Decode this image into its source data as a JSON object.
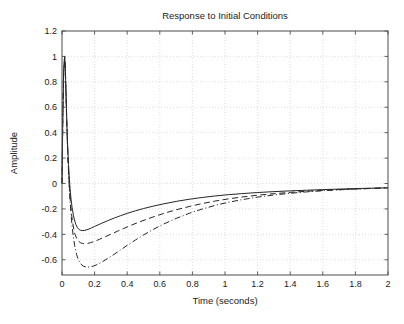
{
  "figure": {
    "background": "#ffffff",
    "axes_color": "#4d4d4d",
    "grid_color": "#c8c8c8",
    "text_color": "#1a1a1a"
  },
  "chart_data": {
    "type": "line",
    "title": "Response to Initial Conditions",
    "xlabel": "Time (seconds)",
    "ylabel": "Amplitude",
    "xlim": [
      0,
      2
    ],
    "ylim": [
      -0.72,
      1.2
    ],
    "xticks": [
      0,
      0.2,
      0.4,
      0.6,
      0.8,
      1,
      1.2,
      1.4,
      1.6,
      1.8,
      2
    ],
    "xticklabels": [
      "0",
      "0.2",
      "0.4",
      "0.6",
      "0.8",
      "1",
      "1.2",
      "1.4",
      "1.6",
      "1.8",
      "2"
    ],
    "yticks": [
      -0.6,
      -0.4,
      -0.2,
      0,
      0.2,
      0.4,
      0.6,
      0.8,
      1,
      1.2
    ],
    "yticklabels": [
      "-0.6",
      "-0.4",
      "-0.2",
      "0",
      "0.2",
      "0.4",
      "0.6",
      "0.8",
      "1",
      "1.2"
    ],
    "grid": true,
    "grid_style": "dotted",
    "legend": null,
    "series": [
      {
        "name": "series-solid",
        "style": "solid",
        "color": "#262626",
        "width": 1.0,
        "points": [
          [
            0.0,
            0.0
          ],
          [
            0.005,
            0.52
          ],
          [
            0.01,
            0.87
          ],
          [
            0.016,
            1.0
          ],
          [
            0.02,
            0.93
          ],
          [
            0.025,
            0.7
          ],
          [
            0.03,
            0.47
          ],
          [
            0.035,
            0.29
          ],
          [
            0.04,
            0.15
          ],
          [
            0.045,
            0.04
          ],
          [
            0.05,
            -0.05
          ],
          [
            0.056,
            -0.13
          ],
          [
            0.062,
            -0.19
          ],
          [
            0.07,
            -0.25
          ],
          [
            0.078,
            -0.295
          ],
          [
            0.086,
            -0.325
          ],
          [
            0.095,
            -0.348
          ],
          [
            0.105,
            -0.362
          ],
          [
            0.115,
            -0.369
          ],
          [
            0.125,
            -0.371
          ],
          [
            0.14,
            -0.369
          ],
          [
            0.16,
            -0.361
          ],
          [
            0.18,
            -0.35
          ],
          [
            0.2,
            -0.338
          ],
          [
            0.24,
            -0.315
          ],
          [
            0.28,
            -0.293
          ],
          [
            0.32,
            -0.272
          ],
          [
            0.36,
            -0.253
          ],
          [
            0.4,
            -0.235
          ],
          [
            0.45,
            -0.215
          ],
          [
            0.5,
            -0.197
          ],
          [
            0.56,
            -0.178
          ],
          [
            0.62,
            -0.161
          ],
          [
            0.7,
            -0.141
          ],
          [
            0.78,
            -0.124
          ],
          [
            0.86,
            -0.11
          ],
          [
            0.94,
            -0.098
          ],
          [
            1.02,
            -0.088
          ],
          [
            1.1,
            -0.08
          ],
          [
            1.2,
            -0.071
          ],
          [
            1.3,
            -0.064
          ],
          [
            1.4,
            -0.058
          ],
          [
            1.5,
            -0.053
          ],
          [
            1.6,
            -0.048
          ],
          [
            1.7,
            -0.044
          ],
          [
            1.8,
            -0.04
          ],
          [
            1.9,
            -0.037
          ],
          [
            2.0,
            -0.034
          ]
        ]
      },
      {
        "name": "series-dashed",
        "style": "dashed",
        "color": "#262626",
        "width": 1.0,
        "points": [
          [
            0.0,
            0.0
          ],
          [
            0.005,
            0.52
          ],
          [
            0.01,
            0.87
          ],
          [
            0.016,
            1.0
          ],
          [
            0.02,
            0.92
          ],
          [
            0.025,
            0.68
          ],
          [
            0.03,
            0.44
          ],
          [
            0.035,
            0.25
          ],
          [
            0.04,
            0.1
          ],
          [
            0.046,
            -0.04
          ],
          [
            0.052,
            -0.15
          ],
          [
            0.058,
            -0.235
          ],
          [
            0.065,
            -0.305
          ],
          [
            0.072,
            -0.358
          ],
          [
            0.08,
            -0.4
          ],
          [
            0.09,
            -0.433
          ],
          [
            0.1,
            -0.452
          ],
          [
            0.112,
            -0.465
          ],
          [
            0.125,
            -0.472
          ],
          [
            0.14,
            -0.474
          ],
          [
            0.155,
            -0.472
          ],
          [
            0.175,
            -0.466
          ],
          [
            0.2,
            -0.455
          ],
          [
            0.23,
            -0.439
          ],
          [
            0.26,
            -0.422
          ],
          [
            0.3,
            -0.399
          ],
          [
            0.34,
            -0.376
          ],
          [
            0.38,
            -0.353
          ],
          [
            0.42,
            -0.331
          ],
          [
            0.47,
            -0.305
          ],
          [
            0.52,
            -0.281
          ],
          [
            0.58,
            -0.254
          ],
          [
            0.64,
            -0.229
          ],
          [
            0.7,
            -0.207
          ],
          [
            0.78,
            -0.181
          ],
          [
            0.86,
            -0.158
          ],
          [
            0.94,
            -0.138
          ],
          [
            1.02,
            -0.121
          ],
          [
            1.1,
            -0.107
          ],
          [
            1.2,
            -0.092
          ],
          [
            1.3,
            -0.08
          ],
          [
            1.4,
            -0.07
          ],
          [
            1.5,
            -0.061
          ],
          [
            1.6,
            -0.054
          ],
          [
            1.7,
            -0.048
          ],
          [
            1.8,
            -0.043
          ],
          [
            1.9,
            -0.038
          ],
          [
            2.0,
            -0.034
          ]
        ]
      },
      {
        "name": "series-dashdot",
        "style": "dashdot",
        "color": "#262626",
        "width": 1.0,
        "points": [
          [
            0.0,
            0.0
          ],
          [
            0.005,
            0.52
          ],
          [
            0.01,
            0.87
          ],
          [
            0.016,
            1.0
          ],
          [
            0.02,
            0.9
          ],
          [
            0.026,
            0.62
          ],
          [
            0.032,
            0.36
          ],
          [
            0.038,
            0.15
          ],
          [
            0.045,
            -0.04
          ],
          [
            0.052,
            -0.185
          ],
          [
            0.06,
            -0.31
          ],
          [
            0.068,
            -0.405
          ],
          [
            0.078,
            -0.49
          ],
          [
            0.09,
            -0.56
          ],
          [
            0.102,
            -0.605
          ],
          [
            0.115,
            -0.633
          ],
          [
            0.13,
            -0.65
          ],
          [
            0.15,
            -0.658
          ],
          [
            0.17,
            -0.657
          ],
          [
            0.19,
            -0.651
          ],
          [
            0.215,
            -0.638
          ],
          [
            0.245,
            -0.618
          ],
          [
            0.28,
            -0.59
          ],
          [
            0.32,
            -0.557
          ],
          [
            0.36,
            -0.522
          ],
          [
            0.4,
            -0.487
          ],
          [
            0.45,
            -0.445
          ],
          [
            0.5,
            -0.405
          ],
          [
            0.56,
            -0.361
          ],
          [
            0.62,
            -0.321
          ],
          [
            0.7,
            -0.275
          ],
          [
            0.78,
            -0.235
          ],
          [
            0.86,
            -0.201
          ],
          [
            0.94,
            -0.172
          ],
          [
            1.02,
            -0.148
          ],
          [
            1.1,
            -0.128
          ],
          [
            1.2,
            -0.107
          ],
          [
            1.3,
            -0.09
          ],
          [
            1.4,
            -0.077
          ],
          [
            1.5,
            -0.066
          ],
          [
            1.6,
            -0.057
          ],
          [
            1.7,
            -0.05
          ],
          [
            1.8,
            -0.044
          ],
          [
            1.9,
            -0.039
          ],
          [
            2.0,
            -0.034
          ]
        ]
      }
    ]
  }
}
